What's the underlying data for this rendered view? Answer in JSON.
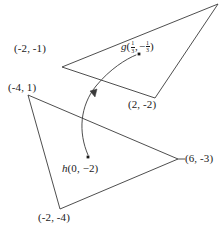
{
  "figure": {
    "stroke_color": "#3a3a3a",
    "text_color": "#1a1a1a",
    "background_color": "#ffffff",
    "upper_triangle": {
      "name": "upper-triangle",
      "vertices": [
        {
          "label": "(-2, -1)",
          "x": 62,
          "y": 67
        },
        {
          "label": "(2, -2)",
          "x": 155,
          "y": 98
        },
        {
          "label": "",
          "x": 218,
          "y": 4
        }
      ]
    },
    "lower_triangle": {
      "name": "lower-triangle",
      "vertices": [
        {
          "label": "(-4, 1)",
          "x": 28,
          "y": 95
        },
        {
          "label": "(6, -3)",
          "x": 178,
          "y": 159
        },
        {
          "label": "(-2, -4)",
          "x": 60,
          "y": 209
        }
      ]
    },
    "points": [
      {
        "name": "point-g",
        "x": 139,
        "y": 54
      },
      {
        "name": "point-h",
        "x": 88,
        "y": 157
      }
    ],
    "labels": {
      "vertex_upper_left": "(-2, -1)",
      "vertex_upper_bottom": "(2, -2)",
      "vertex_lower_topleft": "(-4, 1)",
      "vertex_lower_right": "(6, -3)",
      "vertex_lower_bottom": "(-2, -4)",
      "point_g_name": "g",
      "point_g_open": "(",
      "point_g_x_num": "1",
      "point_g_x_den": "3",
      "point_g_comma": ",",
      "point_g_minus": "−",
      "point_g_y_num": "1",
      "point_g_y_den": "3",
      "point_g_close": ")",
      "point_h_name": "h",
      "point_h_coords": "(0, −2)"
    },
    "arrow": {
      "name": "mapping-arrow",
      "from": "h",
      "to": "g",
      "arrowhead_x": 92,
      "arrowhead_y": 94
    }
  }
}
